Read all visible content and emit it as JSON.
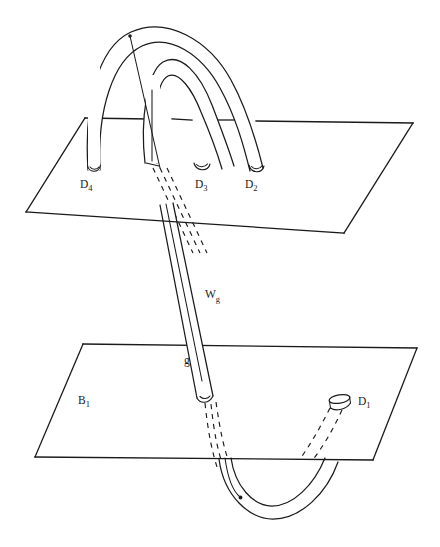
{
  "figure": {
    "background_color": "#ffffff",
    "ink_color": "#1a1a1a",
    "width": 440,
    "height": 547
  },
  "labels": {
    "d4": {
      "base": "D",
      "sub": "4",
      "x": 80,
      "y": 188
    },
    "d3": {
      "base": "D",
      "sub": "3",
      "x": 195,
      "y": 188
    },
    "d2": {
      "base": "D",
      "sub": "2",
      "x": 245,
      "y": 188
    },
    "d1": {
      "base": "D",
      "sub": "1",
      "x": 358,
      "y": 405
    },
    "b1": {
      "base": "B",
      "sub": "1",
      "x": 78,
      "y": 404
    },
    "wg": {
      "base": "W",
      "sub": "g",
      "x": 205,
      "y": 298
    },
    "g": {
      "base": "g",
      "sub": "",
      "x": 184,
      "y": 364
    }
  },
  "planes": {
    "upper": {
      "name": "upper-plane",
      "corners": [
        [
          85,
          118
        ],
        [
          413,
          123
        ],
        [
          344,
          233
        ],
        [
          26,
          212
        ]
      ]
    },
    "lower": {
      "name": "lower-plane-B1",
      "corners": [
        [
          83,
          344
        ],
        [
          417,
          348
        ],
        [
          373,
          460
        ],
        [
          35,
          457
        ]
      ]
    }
  },
  "tubes": {
    "outer_arch": {
      "name": "outer-arch-d4-to-d2",
      "endpoints": [
        "D4",
        "D2"
      ]
    },
    "inner_arch": {
      "name": "inner-arch-g-to-d3",
      "endpoints": [
        "Wg",
        "D3"
      ]
    },
    "long_tube": {
      "name": "long-tube-Wg",
      "label": "W_g"
    },
    "bottom_loop": {
      "name": "bottom-loop-to-d1",
      "endpoints": [
        "Wg",
        "D1"
      ]
    }
  }
}
